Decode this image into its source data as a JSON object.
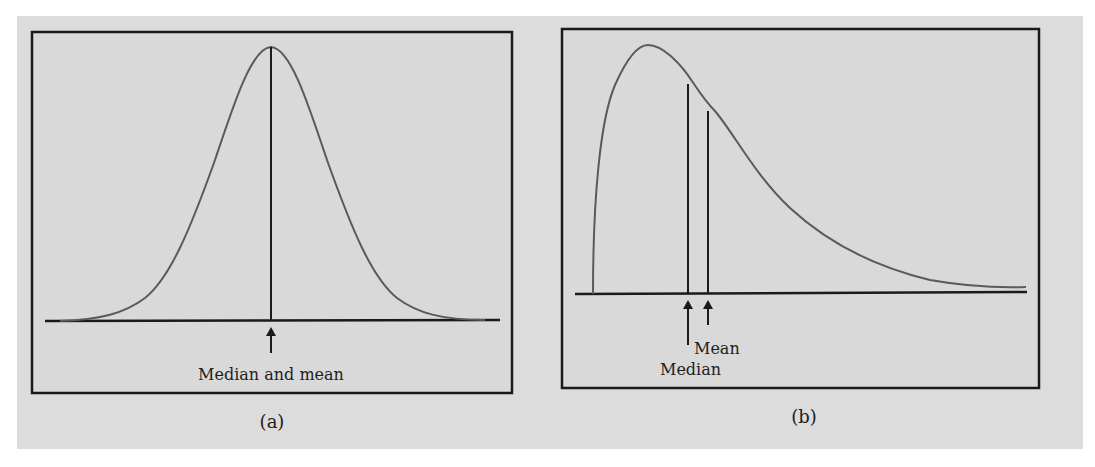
{
  "figure": {
    "background_color": "#dcdcdc",
    "frame_color": "#1a1a1a",
    "curve_color": "#5a5a5a",
    "panels": [
      {
        "id": "a",
        "caption": "(a)",
        "description": "Symmetric distribution",
        "annotations": [
          {
            "label": "Median and mean"
          }
        ]
      },
      {
        "id": "b",
        "caption": "(b)",
        "description": "Right-skewed distribution",
        "annotations": [
          {
            "label": "Mean"
          },
          {
            "label": "Median"
          }
        ]
      }
    ]
  }
}
